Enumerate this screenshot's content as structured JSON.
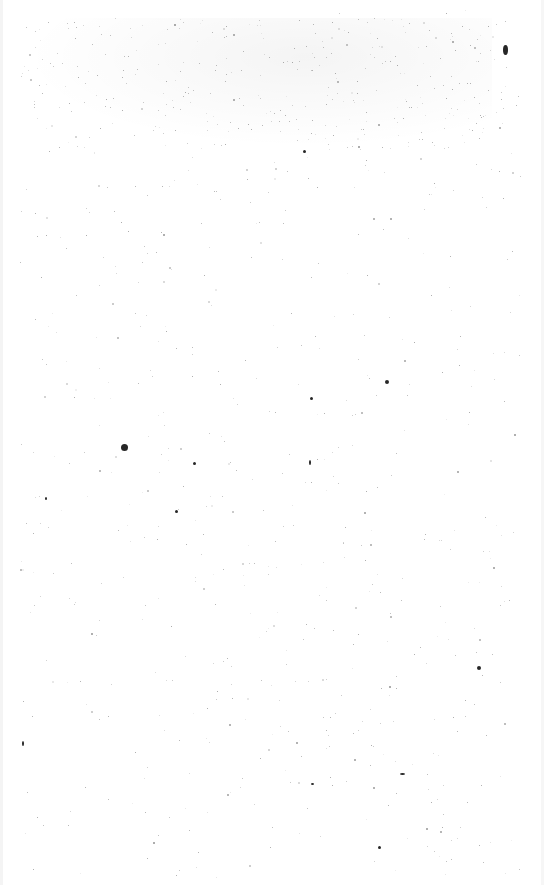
{
  "page": {
    "background": "#ffffff",
    "content": "blank scanned page with speckle noise",
    "text": []
  },
  "noise": {
    "color": "#000000",
    "seed": 7,
    "count": 900,
    "dense_band_top": 18,
    "dense_band_bottom": 150
  },
  "marks": [
    {
      "x": 503,
      "y": 45,
      "w": 5,
      "h": 10
    },
    {
      "x": 385,
      "y": 380,
      "w": 4,
      "h": 4
    },
    {
      "x": 310,
      "y": 397,
      "w": 3,
      "h": 3
    },
    {
      "x": 303,
      "y": 150,
      "w": 3,
      "h": 3
    },
    {
      "x": 477,
      "y": 666,
      "w": 4,
      "h": 4
    },
    {
      "x": 121,
      "y": 444,
      "w": 7,
      "h": 7
    },
    {
      "x": 193,
      "y": 462,
      "w": 3,
      "h": 3
    },
    {
      "x": 175,
      "y": 510,
      "w": 3,
      "h": 3
    },
    {
      "x": 45,
      "y": 497,
      "w": 2,
      "h": 3
    },
    {
      "x": 309,
      "y": 460,
      "w": 2,
      "h": 5
    },
    {
      "x": 22,
      "y": 741,
      "w": 2,
      "h": 5
    },
    {
      "x": 378,
      "y": 846,
      "w": 3,
      "h": 3
    },
    {
      "x": 400,
      "y": 773,
      "w": 5,
      "h": 2
    },
    {
      "x": 311,
      "y": 783,
      "w": 3,
      "h": 2
    }
  ]
}
